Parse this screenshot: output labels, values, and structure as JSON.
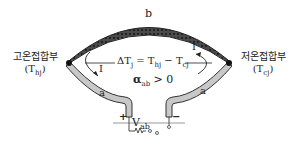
{
  "diagram": {
    "type": "thermocouple",
    "wire_b_label": "b",
    "wire_a_left_label": "a",
    "wire_a_right_label": "a",
    "hot_junction": {
      "label": "고온접합부",
      "symbol": "(T",
      "sub": "hj",
      "close": ")"
    },
    "cold_junction": {
      "label": "저온접합부",
      "symbol": "(T",
      "sub": "cj",
      "close": ")"
    },
    "current_left": "I",
    "current_right": "I",
    "delta_t": {
      "prefix": "ΔT",
      "sub1": "j",
      "eq": " = T",
      "sub2": "hj",
      "minus": " − T",
      "sub3": "cj"
    },
    "alpha": {
      "symbol": "α",
      "sub": "ab",
      "rel": " > 0"
    },
    "voltage": {
      "symbol": "V",
      "sub": "ab"
    },
    "plus": "+",
    "minus": "−",
    "colors": {
      "wire_a": "#c8c8c8",
      "wire_b": "#555555",
      "outline": "#222222"
    }
  }
}
